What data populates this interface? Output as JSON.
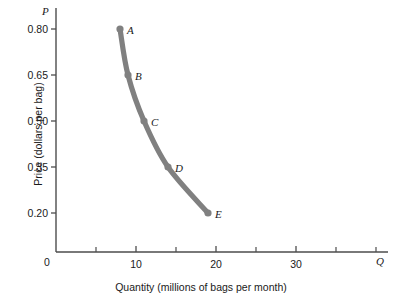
{
  "chart_data": {
    "type": "scatter",
    "title": "",
    "xlabel": "Quantity (millions of bags per month)",
    "ylabel": "Price (dollars per bag)",
    "x_axis_symbol": "Q",
    "y_axis_symbol": "P",
    "origin_label": "0",
    "xlim": [
      0,
      42
    ],
    "ylim": [
      0.125,
      0.875
    ],
    "grid": false,
    "legend": null,
    "curve_color": "#808080",
    "point_color": "#808080",
    "axis_color": "#4d4d4d",
    "xticks_major": [
      {
        "value": 10,
        "label": "10"
      },
      {
        "value": 20,
        "label": "20"
      },
      {
        "value": 30,
        "label": "30"
      }
    ],
    "xticks_minor": [
      5,
      15,
      25,
      35,
      40
    ],
    "yticks": [
      {
        "value": 0.8,
        "label": "0.80"
      },
      {
        "value": 0.65,
        "label": "0.65"
      },
      {
        "value": 0.5,
        "label": "0.50"
      },
      {
        "value": 0.35,
        "label": "0.35"
      },
      {
        "value": 0.2,
        "label": "0.20"
      }
    ],
    "points": [
      {
        "label": "A",
        "x": 8,
        "y": 0.8
      },
      {
        "label": "B",
        "x": 9,
        "y": 0.65
      },
      {
        "label": "C",
        "x": 11,
        "y": 0.5
      },
      {
        "label": "D",
        "x": 14,
        "y": 0.35
      },
      {
        "label": "E",
        "x": 19,
        "y": 0.2
      }
    ]
  }
}
